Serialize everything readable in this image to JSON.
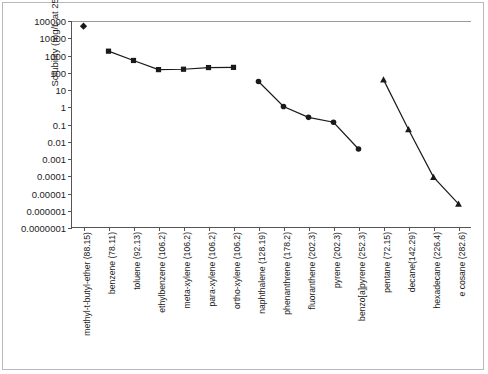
{
  "figure": {
    "ylabel": "Solubility (mg/L at 25°C)"
  },
  "chart_data": {
    "type": "line",
    "title": "",
    "xlabel": "",
    "ylabel": "Solubility (mg/L at 25°C)",
    "yscale": "log",
    "ylim": [
      1e-07,
      100000
    ],
    "grid": false,
    "legend": "none",
    "ytick_labels": [
      "100000",
      "10000",
      "1000",
      "100",
      "10",
      "1",
      "0.1",
      "0.01",
      "0.001",
      "0.0001",
      "0.00001",
      "0.000001",
      "0.0000001"
    ],
    "ytick_values": [
      100000,
      10000,
      1000,
      100,
      10,
      1,
      0.1,
      0.01,
      0.001,
      0.0001,
      1e-05,
      1e-06,
      1e-07
    ],
    "categories": [
      "methyl-t-butyl-ether (88.15)",
      "benzene (78.11)",
      "toluene (92.13)",
      "ethylbenzene (106.2)",
      "meta-xylene (106.2)",
      "para-xylene (106.2)",
      "ortho-xylene (106.2)",
      "naphthalene (128.19)",
      "phenanthrene (178.2)",
      "fluoranthene (202.3)",
      "pyrene (202.3)",
      "benzo[a]pyrene (252.3)",
      "pentane (72.15)",
      "decane(142.29)",
      "hexadecane (226.4)",
      "e cosane (282.6)"
    ],
    "series": [
      {
        "name": "oxygenate",
        "marker": "diamond",
        "connected": false,
        "points": [
          {
            "category": "methyl-t-butyl-ether (88.15)",
            "x": 0,
            "y": 50000
          }
        ]
      },
      {
        "name": "monoaromatics",
        "marker": "square",
        "connected": true,
        "points": [
          {
            "category": "benzene (78.11)",
            "x": 1,
            "y": 1780
          },
          {
            "category": "toluene (92.13)",
            "x": 2,
            "y": 515
          },
          {
            "category": "ethylbenzene (106.2)",
            "x": 3,
            "y": 152
          },
          {
            "category": "meta-xylene (106.2)",
            "x": 4,
            "y": 160
          },
          {
            "category": "para-xylene (106.2)",
            "x": 5,
            "y": 200
          },
          {
            "category": "ortho-xylene (106.2)",
            "x": 6,
            "y": 205
          }
        ]
      },
      {
        "name": "polycyclic aromatic hydrocarbons",
        "marker": "circle",
        "connected": true,
        "points": [
          {
            "category": "naphthalene (128.19)",
            "x": 7,
            "y": 31
          },
          {
            "category": "phenanthrene (178.2)",
            "x": 8,
            "y": 1.1
          },
          {
            "category": "fluoranthene (202.3)",
            "x": 9,
            "y": 0.26
          },
          {
            "category": "pyrene (202.3)",
            "x": 10,
            "y": 0.135
          },
          {
            "category": "benzo[a]pyrene (252.3)",
            "x": 11,
            "y": 0.0038
          }
        ]
      },
      {
        "name": "n-alkanes",
        "marker": "triangle",
        "connected": true,
        "points": [
          {
            "category": "pentane (72.15)",
            "x": 12,
            "y": 40
          },
          {
            "category": "decane(142.29)",
            "x": 13,
            "y": 0.052
          },
          {
            "category": "hexadecane (226.4)",
            "x": 14,
            "y": 9e-05
          },
          {
            "category": "e cosane (282.6)",
            "x": 15,
            "y": 2.5e-06
          }
        ]
      }
    ]
  }
}
